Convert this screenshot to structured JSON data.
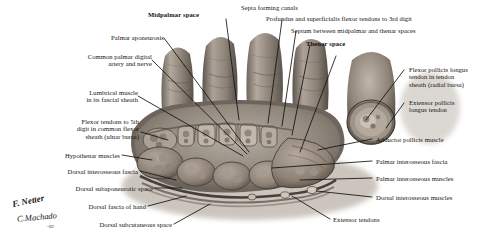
{
  "figure": {
    "kind": "anatomical-illustration",
    "signature_primary": "F. Netter",
    "signature_secondary": "C.Machado",
    "signature_suffix": "-93"
  },
  "labels": {
    "midpalmar_space": "Midpalmar space",
    "septa_forming_canals": "Septa forming canals",
    "profundus_superficialis": "Profundus and superficialis flexor tendons to 3rd digit",
    "septum_between": "Septum between midpalmar and thenar spaces",
    "thenar_space": "Thenar space",
    "palmar_aponeurosis": "Palmar aponeurosis",
    "common_palmar_digital": "Common palmar digital\nartery and nerve",
    "lumbrical_muscle": "Lumbrical muscle\nin its fascial sheath",
    "flexor_tendons_5th": "Flexor tendons to 5th\ndigit in common flexor\nsheath (ulnar bursa)",
    "hypothenar_muscles": "Hypothenar muscles",
    "dorsal_interosseous_fascia": "Dorsal interosseous fascia",
    "dorsal_subaponeurotic_space": "Dorsal subaponeurotic space",
    "dorsal_fascia_of_hand": "Dorsal fascia of hand",
    "dorsal_subcutaneous_space": "Dorsal subcutaneous space",
    "flexor_pollicis_longus": "Flexor pollicis longus\ntendon in tendon\nsheath (radial bursa)",
    "extensor_pollicis_longus": "Extensor pollicis\nlongus tendon",
    "adductor_pollicis_muscle": "Adductor pollicis muscle",
    "palmar_interosseous_fascia": "Palmar interosseous fascia",
    "palmar_interosseous_muscles": "Palmar interosseous muscles",
    "dorsal_interosseous_muscles": "Dorsal interosseous muscles",
    "extensor_tendons": "Extensor tendons"
  },
  "colors": {
    "background": "#ffffff",
    "text": "#15120f",
    "leader": "#1a1714",
    "tissue_mid": "#8d8176",
    "tissue_dark": "#4a423a",
    "tissue_light": "#c9bfb2",
    "skin": "#9b9086",
    "shadow": "#b9b2a9"
  }
}
